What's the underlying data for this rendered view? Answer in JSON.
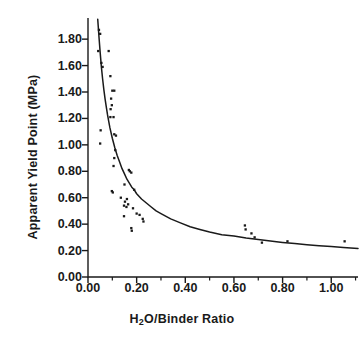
{
  "chart_data": {
    "type": "scatter",
    "title": "",
    "xlabel": "H2O/Binder Ratio",
    "xlabel_html": "H<sub>2</sub>O/Binder Ratio",
    "ylabel": "Apparent Yield Point (MPa)",
    "xlim": [
      0.0,
      1.11
    ],
    "ylim": [
      0.0,
      1.96
    ],
    "xticks": [
      0.0,
      0.2,
      0.4,
      0.6,
      0.8,
      1.0
    ],
    "xticklabels": [
      "0.00",
      "0.20",
      "0.40",
      "0.60",
      "0.80",
      "1.00"
    ],
    "yticks": [
      0.0,
      0.2,
      0.4,
      0.6,
      0.8,
      1.0,
      1.2,
      1.4,
      1.6,
      1.8
    ],
    "yticklabels": [
      "0.00",
      "0.20",
      "0.40",
      "0.60",
      "0.80",
      "1.00",
      "1.20",
      "1.40",
      "1.60",
      "1.80"
    ],
    "xminorticks": [
      0.1,
      0.3,
      0.5,
      0.7,
      0.9,
      1.1
    ],
    "yminorticks": [
      0.1,
      0.3,
      0.5,
      0.7,
      0.9,
      1.1,
      1.3,
      1.5,
      1.7,
      1.9
    ],
    "grid": false,
    "legend": null,
    "tick_direction": "out",
    "axis_style": "left-and-bottom-spines",
    "marker": "small-filled-square",
    "marker_color": "#1a1a1a",
    "line_color": "#1a1a1a",
    "series": [
      {
        "name": "Measured apparent yield point",
        "type": "scatter",
        "points": [
          [
            0.045,
            1.87
          ],
          [
            0.05,
            1.84
          ],
          [
            0.042,
            1.71
          ],
          [
            0.085,
            1.71
          ],
          [
            0.055,
            1.62
          ],
          [
            0.06,
            1.59
          ],
          [
            0.092,
            1.52
          ],
          [
            0.1,
            1.41
          ],
          [
            0.108,
            1.41
          ],
          [
            0.095,
            1.35
          ],
          [
            0.098,
            1.3
          ],
          [
            0.093,
            1.27
          ],
          [
            0.092,
            1.21
          ],
          [
            0.105,
            1.21
          ],
          [
            0.052,
            1.11
          ],
          [
            0.108,
            1.08
          ],
          [
            0.115,
            1.07
          ],
          [
            0.05,
            1.01
          ],
          [
            0.112,
            0.96
          ],
          [
            0.108,
            0.9
          ],
          [
            0.105,
            0.84
          ],
          [
            0.168,
            0.81
          ],
          [
            0.172,
            0.8
          ],
          [
            0.178,
            0.79
          ],
          [
            0.15,
            0.7
          ],
          [
            0.098,
            0.65
          ],
          [
            0.102,
            0.64
          ],
          [
            0.19,
            0.66
          ],
          [
            0.135,
            0.6
          ],
          [
            0.16,
            0.59
          ],
          [
            0.152,
            0.57
          ],
          [
            0.165,
            0.55
          ],
          [
            0.148,
            0.54
          ],
          [
            0.158,
            0.53
          ],
          [
            0.185,
            0.52
          ],
          [
            0.148,
            0.46
          ],
          [
            0.2,
            0.48
          ],
          [
            0.212,
            0.47
          ],
          [
            0.225,
            0.44
          ],
          [
            0.228,
            0.42
          ],
          [
            0.178,
            0.37
          ],
          [
            0.18,
            0.35
          ],
          [
            0.645,
            0.39
          ],
          [
            0.648,
            0.36
          ],
          [
            0.672,
            0.33
          ],
          [
            0.685,
            0.3
          ],
          [
            0.715,
            0.26
          ],
          [
            0.82,
            0.27
          ],
          [
            1.055,
            0.27
          ]
        ]
      },
      {
        "name": "Fitted power-law curve",
        "type": "line",
        "points": [
          [
            0.04,
            1.95
          ],
          [
            0.045,
            1.82
          ],
          [
            0.05,
            1.7
          ],
          [
            0.055,
            1.59
          ],
          [
            0.06,
            1.5
          ],
          [
            0.065,
            1.42
          ],
          [
            0.07,
            1.35
          ],
          [
            0.075,
            1.29
          ],
          [
            0.08,
            1.23
          ],
          [
            0.085,
            1.18
          ],
          [
            0.09,
            1.13
          ],
          [
            0.095,
            1.09
          ],
          [
            0.1,
            1.05
          ],
          [
            0.11,
            0.98
          ],
          [
            0.12,
            0.92
          ],
          [
            0.13,
            0.87
          ],
          [
            0.14,
            0.82
          ],
          [
            0.15,
            0.78
          ],
          [
            0.16,
            0.74
          ],
          [
            0.17,
            0.71
          ],
          [
            0.18,
            0.68
          ],
          [
            0.19,
            0.66
          ],
          [
            0.2,
            0.63
          ],
          [
            0.22,
            0.59
          ],
          [
            0.24,
            0.56
          ],
          [
            0.26,
            0.53
          ],
          [
            0.28,
            0.5
          ],
          [
            0.3,
            0.48
          ],
          [
            0.34,
            0.44
          ],
          [
            0.38,
            0.41
          ],
          [
            0.42,
            0.38
          ],
          [
            0.46,
            0.36
          ],
          [
            0.5,
            0.34
          ],
          [
            0.55,
            0.32
          ],
          [
            0.6,
            0.31
          ],
          [
            0.65,
            0.295
          ],
          [
            0.7,
            0.283
          ],
          [
            0.75,
            0.272
          ],
          [
            0.8,
            0.262
          ],
          [
            0.85,
            0.253
          ],
          [
            0.9,
            0.245
          ],
          [
            0.95,
            0.237
          ],
          [
            1.0,
            0.23
          ],
          [
            1.05,
            0.223
          ],
          [
            1.11,
            0.216
          ]
        ]
      }
    ]
  }
}
